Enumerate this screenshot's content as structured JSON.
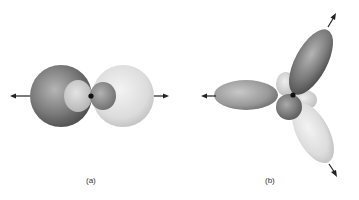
{
  "figure": {
    "panels": [
      {
        "id": "a",
        "label": "(a)",
        "description": "sp hybrid orbitals, two lobes along a line, 180 degrees apart"
      },
      {
        "id": "b",
        "label": "(b)",
        "description": "sp2 hybrid orbitals, three lobes in a plane, 120 degrees apart"
      }
    ]
  },
  "colors": {
    "dark_lobe": "#6e6e6e",
    "light_lobe": "#d8d8d8",
    "mid_lobe": "#a0a0a0",
    "nucleus": "#111111",
    "arrow": "#222222"
  }
}
